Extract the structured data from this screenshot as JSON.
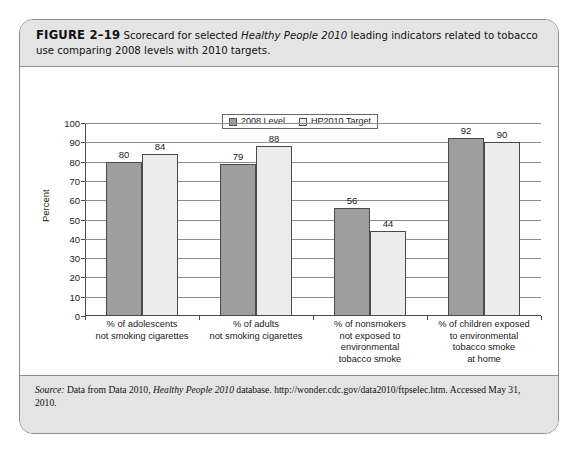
{
  "figure": {
    "number_label": "FIGURE 2–19",
    "caption_part1": "Scorecard for selected ",
    "caption_italic": "Healthy People 2010",
    "caption_part2": " leading indicators related to tobacco use comparing 2008 levels with 2010 targets."
  },
  "source": {
    "label": "Source:",
    "part1": " Data from Data 2010, ",
    "italic": "Healthy People 2010",
    "part2": " database. http://wonder.cdc.gov/data2010/ftpselec.htm. Accessed May 31, 2010."
  },
  "colors": {
    "series_2008": "#9e9e9e",
    "series_target": "#ececec",
    "band_background": "#e4e4e4",
    "frame": "#8c8c8c",
    "axis": "#4a4a4a",
    "gridline": "#8e8e8e"
  },
  "chart_data": {
    "type": "bar",
    "title": "",
    "xlabel": "",
    "ylabel": "Percent",
    "ylim": [
      0,
      100
    ],
    "yticks": [
      0,
      10,
      20,
      30,
      40,
      50,
      60,
      70,
      80,
      90,
      100
    ],
    "grid": true,
    "legend_position": "top-center",
    "categories": [
      "% of adolescents\nnot smoking cigarettes",
      "% of adults\nnot smoking cigarettes",
      "% of nonsmokers\nnot exposed to\nenvironmental\ntobacco smoke",
      "% of children exposed\nto environmental\ntobacco smoke\nat home"
    ],
    "category_lines": [
      [
        "% of adolescents",
        "not smoking cigarettes"
      ],
      [
        "% of adults",
        "not smoking cigarettes"
      ],
      [
        "% of nonsmokers",
        "not exposed to",
        "environmental",
        "tobacco smoke"
      ],
      [
        "% of children exposed",
        "to environmental",
        "tobacco smoke",
        "at home"
      ]
    ],
    "series": [
      {
        "name": "2008 Level",
        "values": [
          80,
          79,
          56,
          92
        ]
      },
      {
        "name": "HP2010 Target",
        "values": [
          84,
          88,
          44,
          90
        ]
      }
    ]
  }
}
